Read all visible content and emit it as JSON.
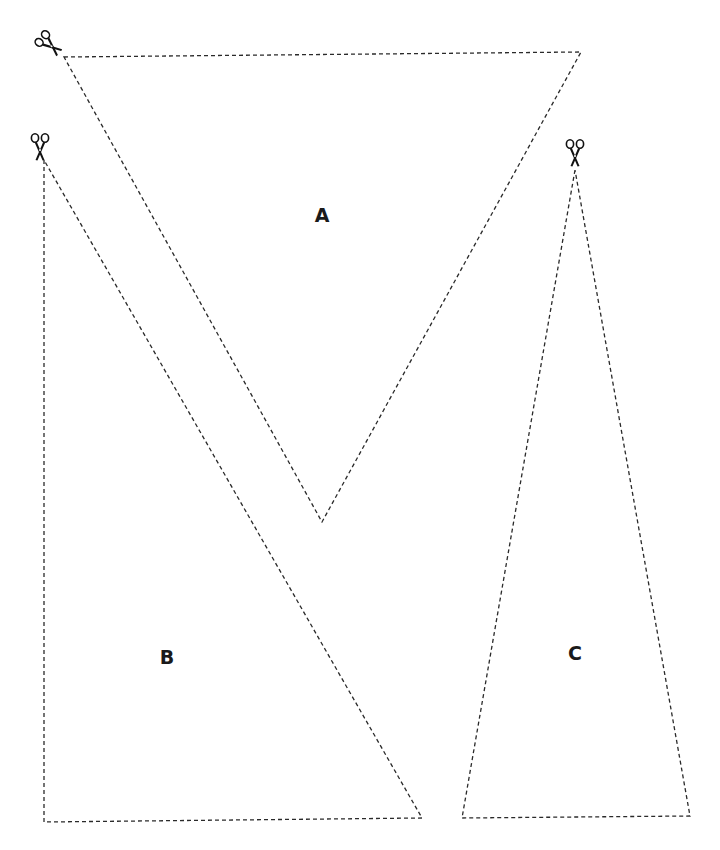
{
  "diagram": {
    "type": "cut-out triangles worksheet",
    "line_style": "dashed",
    "colors": {
      "background": "#ffffff",
      "line": "#2a2a2a",
      "label": "#1a1a1a"
    },
    "shapes": [
      {
        "id": "A",
        "label": "A",
        "kind": "triangle",
        "vertices": [
          [
            64,
            57
          ],
          [
            581,
            52
          ],
          [
            322,
            522
          ]
        ],
        "label_position": [
          322,
          222
        ],
        "icon": "scissors-icon"
      },
      {
        "id": "B",
        "label": "B",
        "kind": "right-triangle",
        "vertices": [
          [
            44,
            160
          ],
          [
            44,
            822
          ],
          [
            422,
            818
          ]
        ],
        "label_position": [
          167,
          664
        ],
        "icon": "scissors-icon"
      },
      {
        "id": "C",
        "label": "C",
        "kind": "triangle",
        "vertices": [
          [
            575,
            170
          ],
          [
            462,
            818
          ],
          [
            690,
            816
          ]
        ],
        "label_position": [
          575,
          660
        ],
        "icon": "scissors-icon"
      }
    ],
    "icons": [
      {
        "name": "scissors-icon",
        "position": [
          50,
          45
        ],
        "rotation": -45,
        "shape": "A"
      },
      {
        "name": "scissors-icon",
        "position": [
          40,
          148
        ],
        "rotation": 0,
        "shape": "B"
      },
      {
        "name": "scissors-icon",
        "position": [
          575,
          154
        ],
        "rotation": 0,
        "shape": "C"
      }
    ]
  },
  "labels": {
    "a": "A",
    "b": "B",
    "c": "C"
  }
}
